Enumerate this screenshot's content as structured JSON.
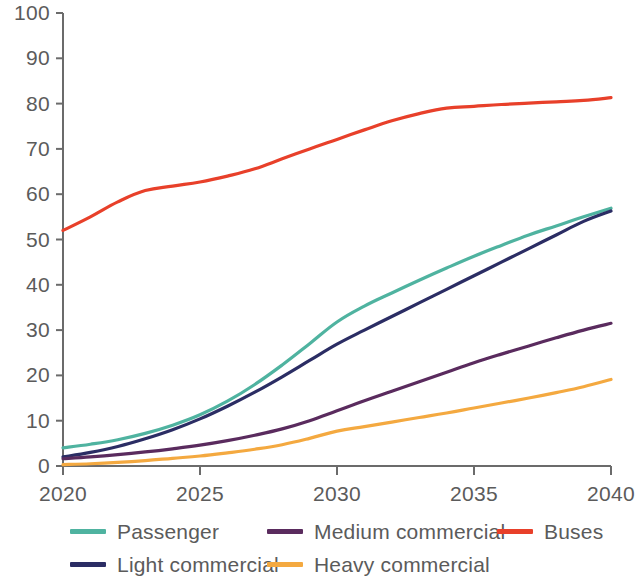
{
  "chart_data": {
    "type": "line",
    "title": "",
    "subtitle": "",
    "xlabel": "",
    "ylabel": "",
    "xlim": [
      2020,
      2040
    ],
    "ylim": [
      0,
      100
    ],
    "grid": false,
    "legend_position": "bottom",
    "x_ticks": [
      "2020",
      "2025",
      "2030",
      "2035",
      "2040"
    ],
    "x_tick_values": [
      2020,
      2025,
      2030,
      2035,
      2040
    ],
    "y_ticks": [
      "0",
      "10",
      "20",
      "30",
      "40",
      "50",
      "60",
      "70",
      "80",
      "90",
      "100"
    ],
    "y_tick_values": [
      0,
      10,
      20,
      30,
      40,
      50,
      60,
      70,
      80,
      90,
      100
    ],
    "x": [
      2020,
      2021,
      2022,
      2023,
      2024,
      2025,
      2026,
      2027,
      2028,
      2029,
      2030,
      2031,
      2032,
      2033,
      2034,
      2035,
      2036,
      2037,
      2038,
      2039,
      2040
    ],
    "series": [
      {
        "name": "Passenger",
        "color": "#4FB3A0",
        "values": [
          4.0,
          4.8,
          5.8,
          7.2,
          9.0,
          11.3,
          14.3,
          18.0,
          22.3,
          27.0,
          31.8,
          35.3,
          38.2,
          41.0,
          43.7,
          46.3,
          48.7,
          51.0,
          53.0,
          55.0,
          56.9
        ]
      },
      {
        "name": "Light commercial",
        "color": "#2B2D64",
        "values": [
          2.0,
          3.0,
          4.3,
          6.0,
          8.0,
          10.4,
          13.2,
          16.3,
          19.7,
          23.3,
          26.9,
          30.0,
          33.0,
          36.0,
          39.0,
          42.0,
          45.0,
          48.0,
          51.0,
          54.0,
          56.3
        ]
      },
      {
        "name": "Medium commercial",
        "color": "#5A2B5E",
        "values": [
          1.6,
          2.0,
          2.5,
          3.1,
          3.8,
          4.6,
          5.6,
          6.8,
          8.2,
          10.0,
          12.2,
          14.4,
          16.5,
          18.6,
          20.7,
          22.8,
          24.7,
          26.5,
          28.3,
          30.0,
          31.5
        ]
      },
      {
        "name": "Heavy commercial",
        "color": "#F4A940",
        "values": [
          0.3,
          0.5,
          0.8,
          1.2,
          1.7,
          2.2,
          2.9,
          3.7,
          4.7,
          6.1,
          7.7,
          8.7,
          9.7,
          10.7,
          11.7,
          12.8,
          13.9,
          15.0,
          16.2,
          17.5,
          19.1
        ]
      },
      {
        "name": "Buses",
        "color": "#E8402A",
        "values": [
          52.0,
          55.0,
          58.3,
          60.8,
          61.8,
          62.7,
          64.0,
          65.6,
          67.8,
          70.0,
          72.1,
          74.2,
          76.2,
          77.8,
          79.0,
          79.4,
          79.8,
          80.1,
          80.4,
          80.7,
          81.3
        ]
      }
    ]
  },
  "axis": {
    "line_color": "#6b6b6b",
    "label_color": "#5b5b5b"
  },
  "legend": {
    "items": [
      {
        "label": "Passenger",
        "color": "#4FB3A0",
        "col": 0,
        "row": 0
      },
      {
        "label": "Medium commercial",
        "color": "#5A2B5E",
        "col": 1,
        "row": 0
      },
      {
        "label": "Buses",
        "color": "#E8402A",
        "col": 2,
        "row": 0
      },
      {
        "label": "Light commercial",
        "color": "#2B2D64",
        "col": 0,
        "row": 1
      },
      {
        "label": "Heavy commercial",
        "color": "#F4A940",
        "col": 1,
        "row": 1
      }
    ]
  }
}
